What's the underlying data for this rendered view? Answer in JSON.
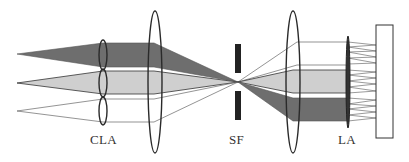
{
  "diagram": {
    "type": "optical-setup",
    "labels": {
      "cla": "CLA",
      "sf": "SF",
      "la": "LA"
    },
    "components": [
      {
        "id": "cla",
        "name": "cylindrical lens array (three lenslets)"
      },
      {
        "id": "lens1",
        "name": "collimating / focusing lens"
      },
      {
        "id": "sf",
        "name": "spatial filter (slit)"
      },
      {
        "id": "lens2",
        "name": "relay lens"
      },
      {
        "id": "la",
        "name": "lens array"
      },
      {
        "id": "screen",
        "name": "target plane"
      }
    ],
    "beams": [
      {
        "id": "top",
        "fill": "#6e6e6e"
      },
      {
        "id": "middle",
        "fill": "#cfcfcf"
      },
      {
        "id": "bottom",
        "fill": "none"
      }
    ],
    "colors": {
      "dark_beam": "#6e6e6e",
      "light_beam": "#cfcfcf",
      "outline": "#2a2a2a",
      "ray": "#555555"
    }
  }
}
